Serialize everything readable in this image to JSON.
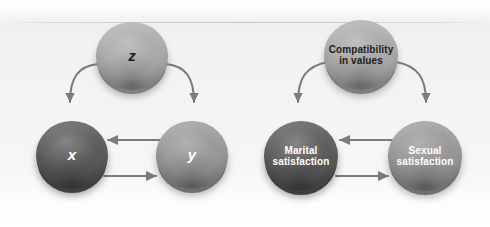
{
  "figure": {
    "panels": [
      {
        "id": "abstract",
        "name": "abstract-variable-panel",
        "nodes": [
          {
            "id": "z",
            "label": "z",
            "style": "light",
            "text_style": "variable"
          },
          {
            "id": "x",
            "label": "x",
            "style": "dark",
            "text_style": "variable"
          },
          {
            "id": "y",
            "label": "y",
            "style": "mid",
            "text_style": "variable"
          }
        ],
        "edges": [
          {
            "from": "z",
            "to": "x",
            "shape": "curved",
            "direction": "down-left"
          },
          {
            "from": "z",
            "to": "y",
            "shape": "curved",
            "direction": "down-right"
          },
          {
            "from": "y",
            "to": "x",
            "shape": "straight",
            "direction": "left"
          },
          {
            "from": "x",
            "to": "y",
            "shape": "straight",
            "direction": "right"
          }
        ]
      },
      {
        "id": "example",
        "name": "marital-satisfaction-panel",
        "nodes": [
          {
            "id": "compatibility",
            "label": "Compatibility\nin values",
            "line1": "Compatibility",
            "line2": "in values",
            "style": "light",
            "text_style": "text"
          },
          {
            "id": "marital",
            "label": "Marital\nsatisfaction",
            "line1": "Marital",
            "line2": "satisfaction",
            "style": "dark",
            "text_style": "text"
          },
          {
            "id": "sexual",
            "label": "Sexual\nsatisfaction",
            "line1": "Sexual",
            "line2": "satisfaction",
            "style": "mid",
            "text_style": "text"
          }
        ],
        "edges": [
          {
            "from": "compatibility",
            "to": "marital",
            "shape": "curved",
            "direction": "down-left"
          },
          {
            "from": "compatibility",
            "to": "sexual",
            "shape": "curved",
            "direction": "down-right"
          },
          {
            "from": "sexual",
            "to": "marital",
            "shape": "straight",
            "direction": "left"
          },
          {
            "from": "marital",
            "to": "sexual",
            "shape": "straight",
            "direction": "right"
          }
        ]
      }
    ],
    "colors": {
      "node_light": "#a9a9a9",
      "node_mid": "#979797",
      "node_dark": "#5b5b5b",
      "arrow": "#7b7b7b",
      "background": "#f4f4f4",
      "label_light_text": "#1d1d1d",
      "label_dark_text": "#ffffff"
    }
  }
}
